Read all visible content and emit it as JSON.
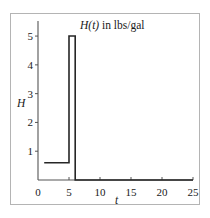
{
  "chart_data": {
    "type": "line",
    "title": "H(t) in lbs/gal",
    "title_parts": {
      "italic": "H(t)",
      "roman": " in lbs/gal"
    },
    "xlabel": "t",
    "ylabel": "H",
    "xlim": [
      0,
      25
    ],
    "ylim": [
      0,
      5.35
    ],
    "grid": false,
    "legend": null,
    "xticks": [
      0,
      5,
      10,
      15,
      20,
      25
    ],
    "xtick_labels": [
      "0",
      "5",
      "10",
      "15",
      "20",
      "25"
    ],
    "yticks": [
      1,
      2,
      3,
      4,
      5
    ],
    "ytick_labels": [
      "1",
      "2",
      "3",
      "4",
      "5"
    ],
    "series": [
      {
        "name": "H(t)",
        "color": "#262626",
        "line_width": 1.6,
        "description": "Piecewise-constant step: H=0.6 on 1<=t<5, H=5 on 5<=t<6, H=0 for t>=6",
        "points": [
          {
            "x": 1,
            "y": 0.6
          },
          {
            "x": 5,
            "y": 0.6
          },
          {
            "x": 5,
            "y": 5
          },
          {
            "x": 6,
            "y": 5
          },
          {
            "x": 6,
            "y": 0
          },
          {
            "x": 25,
            "y": 0
          }
        ]
      }
    ],
    "annotations": {
      "baseline_value": 0.6,
      "pulse_value": 5,
      "pulse_start": 5,
      "pulse_end": 6,
      "baseline_start": 1
    }
  },
  "figure": {
    "background_color": "#ffffff",
    "frame_color": "#b4b4b4",
    "axis_color": "#555555",
    "text_color": "#1a1a1a"
  }
}
